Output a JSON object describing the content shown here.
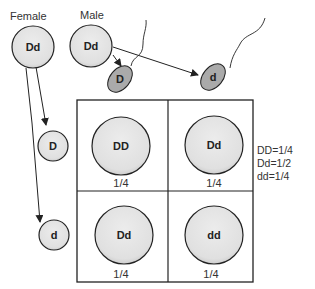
{
  "parents": {
    "female": {
      "label": "Female",
      "genotype": "Dd"
    },
    "male": {
      "label": "Male",
      "genotype": "Dd"
    }
  },
  "gametes": {
    "sperm": [
      "D",
      "d"
    ],
    "eggs": [
      "D",
      "d"
    ]
  },
  "punnett": {
    "cells": [
      {
        "genotype": "DD",
        "fraction": "1/4"
      },
      {
        "genotype": "Dd",
        "fraction": "1/4"
      },
      {
        "genotype": "Dd",
        "fraction": "1/4"
      },
      {
        "genotype": "dd",
        "fraction": "1/4"
      }
    ]
  },
  "ratios": [
    "DD=1/4",
    "Dd=1/2",
    "dd=1/4"
  ],
  "colors": {
    "cell_fill": "#e2e2e2",
    "sperm_fill": "#aaaaaa",
    "stroke": "#222222"
  }
}
